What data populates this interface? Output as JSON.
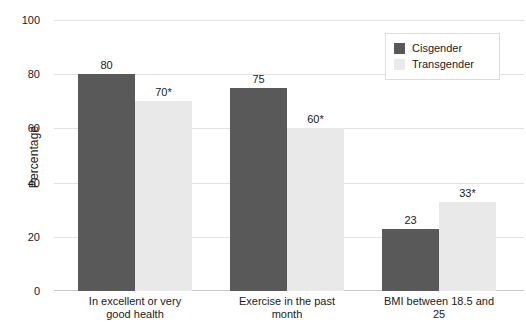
{
  "figure": {
    "background": "#ffffff",
    "cropped_title": "",
    "colors": {
      "cisgender": "#595959",
      "transgender": "#e9e9e9",
      "gridline": "#e2e2e2",
      "axis": "#c9c9c9",
      "text": "#1a1a1a",
      "legend_border": "#dcdcdc"
    }
  },
  "legend": {
    "position": "top-right",
    "entries": [
      {
        "label": "Cisgender",
        "color": "#595959"
      },
      {
        "label": "Transgender",
        "color": "#e9e9e9"
      }
    ]
  },
  "chart_data": {
    "type": "bar",
    "title": "",
    "xlabel": "",
    "ylabel": "Percentage",
    "ylim": [
      0,
      100
    ],
    "yticks": [
      0,
      20,
      40,
      60,
      80,
      100
    ],
    "ytick_labels": [
      "0",
      "20",
      "40",
      "60",
      "80",
      "100"
    ],
    "grid": true,
    "legend_position": "upper right",
    "categories": [
      "In excellent or very good health",
      "Exercise in the past month",
      "BMI between 18.5 and 25"
    ],
    "category_lines": [
      [
        "In excellent or very",
        "good health"
      ],
      [
        "Exercise in the past month"
      ],
      [
        "BMI between 18.5 and 25"
      ]
    ],
    "series": [
      {
        "name": "Cisgender",
        "color": "#595959",
        "values": [
          80,
          75,
          23
        ],
        "data_labels": [
          "80",
          "75",
          "23"
        ]
      },
      {
        "name": "Transgender",
        "color": "#e9e9e9",
        "values": [
          70,
          60,
          33
        ],
        "data_labels": [
          "70*",
          "60*",
          "33*"
        ]
      }
    ],
    "annotations": [
      "* indicates statistically significant difference"
    ]
  }
}
